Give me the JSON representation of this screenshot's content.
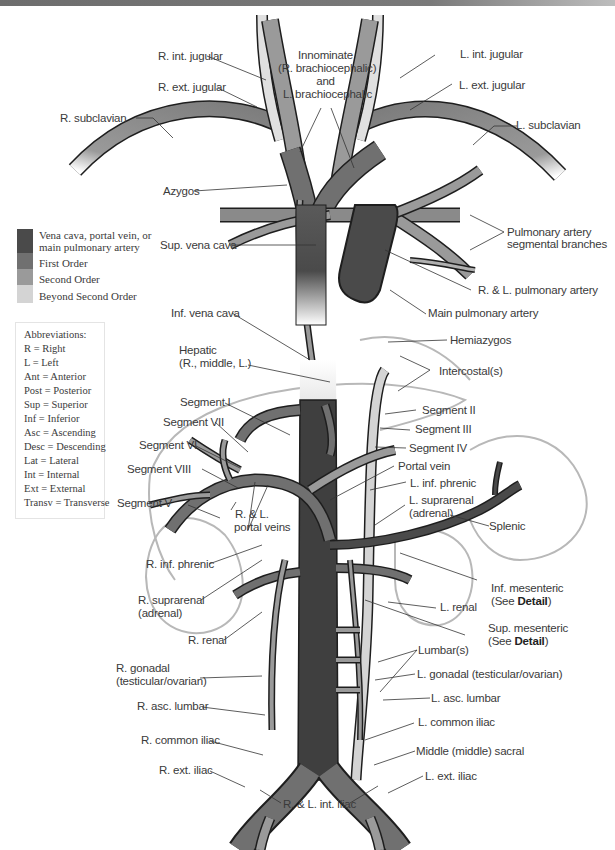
{
  "figure": {
    "type": "anatomical-diagram"
  },
  "legend": {
    "items": [
      {
        "label_line1": "Vena cava, portal vein, or",
        "label_line2": "main pulmonary artery",
        "color": "#4a4a4a"
      },
      {
        "label": "First Order",
        "color": "#707070"
      },
      {
        "label": "Second Order",
        "color": "#9a9a9a"
      },
      {
        "label": "Beyond Second Order",
        "color": "#d4d4d4"
      }
    ]
  },
  "abbreviations": {
    "title": "Abbreviations:",
    "items": [
      "R = Right",
      "L = Left",
      "Ant = Anterior",
      "Post = Posterior",
      "Sup = Superior",
      "Inf = Inferior",
      "Asc = Ascending",
      "Desc = Descending",
      "Lat = Lateral",
      "Int = Internal",
      "Ext = External",
      "Transv = Transverse"
    ]
  },
  "labels": {
    "r_int_jugular": "R. int. jugular",
    "r_ext_jugular": "R. ext. jugular",
    "r_subclavian": "R. subclavian",
    "innominate_1": "Innominate",
    "innominate_2": "(R. brachiocephalic)",
    "innominate_3": "and",
    "innominate_4": "L. brachiocephalic",
    "l_int_jugular": "L. int. jugular",
    "l_ext_jugular": "L. ext. jugular",
    "l_subclavian": "L. subclavian",
    "azygos": "Azygos",
    "pulm_seg_1": "Pulmonary artery",
    "pulm_seg_2": "segmental branches",
    "sup_vena_cava": "Sup. vena cava",
    "rl_pulmonary": "R. & L. pulmonary artery",
    "main_pulmonary": "Main pulmonary artery",
    "inf_vena_cava": "Inf. vena cava",
    "hemiazygos": "Hemiazygos",
    "hepatic_1": "Hepatic",
    "hepatic_2": "(R., middle, L.)",
    "intercostals": "Intercostal(s)",
    "segment_i": "Segment I",
    "segment_ii": "Segment II",
    "segment_iii": "Segment III",
    "segment_vii": "Segment VII",
    "segment_iv": "Segment IV",
    "segment_vi": "Segment VI",
    "portal_vein": "Portal vein",
    "segment_viii": "Segment VIII",
    "l_inf_phrenic": "L. inf. phrenic",
    "l_suprarenal_1": "L. suprarenal",
    "l_suprarenal_2": "(adrenal)",
    "segment_v": "Segment V",
    "rl_portal_1": "R. & L.",
    "rl_portal_2": "portal veins",
    "splenic": "Splenic",
    "r_inf_phrenic": "R. inf. phrenic",
    "inf_mesenteric_1": "Inf. mesenteric",
    "inf_mesenteric_2_pre": "(See ",
    "inf_mesenteric_2_bold": "Detail",
    "inf_mesenteric_2_post": ")",
    "r_suprarenal_1": "R. suprarenal",
    "r_suprarenal_2": "(adrenal)",
    "l_renal": "L. renal",
    "r_renal": "R. renal",
    "sup_mesenteric_1": "Sup. mesenteric",
    "sup_mesenteric_2_pre": "(See ",
    "sup_mesenteric_2_bold": "Detail",
    "sup_mesenteric_2_post": ")",
    "lumbars": "Lumbar(s)",
    "r_gonadal_1": "R. gonadal",
    "r_gonadal_2": "(testicular/ovarian)",
    "l_gonadal": "L. gonadal (testicular/ovarian)",
    "l_asc_lumbar": "L. asc. lumbar",
    "r_asc_lumbar": "R. asc. lumbar",
    "l_common_iliac": "L. common iliac",
    "r_common_iliac": "R. common iliac",
    "middle_sacral": "Middle (middle) sacral",
    "r_ext_iliac": "R. ext. iliac",
    "l_ext_iliac": "L. ext. iliac",
    "rl_int_iliac": "R. & L. int. iliac"
  },
  "colors": {
    "main": "#4a4a4a",
    "first_order": "#707070",
    "second_order": "#9a9a9a",
    "beyond": "#d4d4d4",
    "outline": "#1e1e1e",
    "organ_outline": "#b4b4b4",
    "leader": "#333333"
  }
}
